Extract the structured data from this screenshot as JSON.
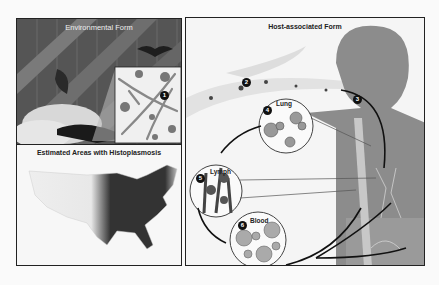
{
  "panels": {
    "environmental": {
      "title": "Environmental Form",
      "step": "1"
    },
    "map": {
      "title": "Estimated Areas with Histoplasmosis"
    },
    "host": {
      "title": "Host-associated Form",
      "steps": [
        {
          "num": "2",
          "label": ""
        },
        {
          "num": "3",
          "label": ""
        },
        {
          "num": "4",
          "label": "Lung"
        },
        {
          "num": "5",
          "label": "Lymph"
        },
        {
          "num": "6",
          "label": "Blood"
        }
      ]
    }
  },
  "colors": {
    "border": "#222222",
    "dark": "#3a3a3a",
    "mid": "#8a8a8a",
    "light": "#d0d0d0",
    "bg": "#f5f5f5"
  }
}
